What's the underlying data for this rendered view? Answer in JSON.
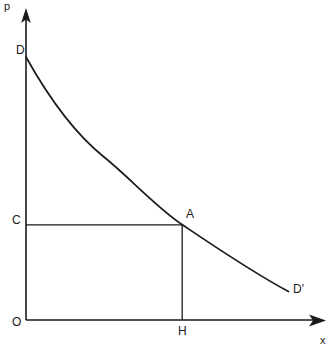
{
  "figure": {
    "type": "economics-demand-curve-diagram",
    "background_color": "#ffffff",
    "line_color": "#1a1a1a",
    "width": 334,
    "height": 349,
    "axes": {
      "vertical": {
        "label": "p",
        "label_name": "price-axis-label",
        "origin_px": {
          "x": 26,
          "y": 320
        },
        "tip_px": {
          "x": 26,
          "y": 9
        }
      },
      "horizontal": {
        "label": "x",
        "label_name": "quantity-axis-label",
        "origin_px": {
          "x": 26,
          "y": 320
        },
        "tip_px": {
          "x": 325,
          "y": 320
        }
      }
    },
    "curve": {
      "name": "demand-curve",
      "start_label": "D",
      "end_label": "D'",
      "start_px": {
        "x": 26,
        "y": 57
      },
      "end_px": {
        "x": 288,
        "y": 291
      },
      "path": "M 26 57 C 52 104, 78 140, 104 159 C 130 179, 156 206, 182 224 C 214 246, 252 272, 288 291"
    },
    "points": [
      {
        "label": "O",
        "name": "origin-point-label",
        "x": 26,
        "y": 320
      },
      {
        "label": "D",
        "name": "curve-start-point-label",
        "x": 26,
        "y": 57
      },
      {
        "label": "C",
        "name": "price-level-point-label",
        "x": 26,
        "y": 225
      },
      {
        "label": "A",
        "name": "equilibrium-point-label",
        "x": 182,
        "y": 224
      },
      {
        "label": "H",
        "name": "quantity-point-label",
        "x": 182,
        "y": 320
      },
      {
        "label": "D'",
        "name": "curve-end-point-label",
        "x": 288,
        "y": 291
      }
    ],
    "rectangle": {
      "name": "revenue-rectangle-ocah",
      "vertices": "O-C-A-H",
      "left_x": 26,
      "right_x": 182,
      "top_y": 225,
      "bottom_y": 320
    },
    "labels": {
      "p": "p",
      "x": "x",
      "D": "D",
      "D_prime": "D'",
      "A": "A",
      "C": "C",
      "O": "O",
      "H": "H"
    }
  }
}
